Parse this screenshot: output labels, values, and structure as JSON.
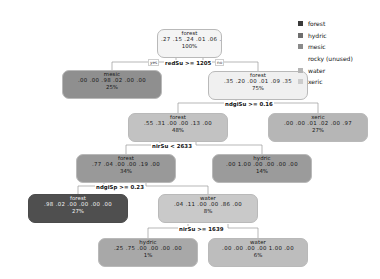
{
  "chart_data": {
    "type": "diagram",
    "subtype": "decision-tree",
    "title": "",
    "class_order": [
      "forest",
      "hydric",
      "mesic",
      "rocky",
      "water",
      "xeric"
    ],
    "legend": {
      "position": "top-right",
      "entries": [
        {
          "label": "forest",
          "color": "#3a3a3a",
          "has_swatch": true
        },
        {
          "label": "hydric",
          "color": "#6e6e6e",
          "has_swatch": true
        },
        {
          "label": "mesic",
          "color": "#8a8a8a",
          "has_swatch": true
        },
        {
          "label": "rocky (unused)",
          "color": "",
          "has_swatch": false
        },
        {
          "label": "water",
          "color": "#b5b5b5",
          "has_swatch": true
        },
        {
          "label": "xeric",
          "color": "#cccccc",
          "has_swatch": true
        }
      ]
    },
    "splits": [
      {
        "id": "split-redsu",
        "text": "redSu >= 1205",
        "yes_label": "yes",
        "no_label": "no"
      },
      {
        "id": "split-ndgisu",
        "text": "ndgiSu >= 0.16",
        "yes_label": "",
        "no_label": ""
      },
      {
        "id": "split-nirsu-2633",
        "text": "nirSu < 2633",
        "yes_label": "",
        "no_label": ""
      },
      {
        "id": "split-ndgisp",
        "text": "ndgiSp >= 0.23",
        "yes_label": "",
        "no_label": ""
      },
      {
        "id": "split-nirsu-1639",
        "text": "nirSu >= 1639",
        "yes_label": "",
        "no_label": ""
      }
    ],
    "nodes": [
      {
        "id": "root",
        "label": "forest",
        "probs": [
          ".27",
          ".15",
          ".24",
          ".01",
          ".06",
          ".27"
        ],
        "pct": "100%",
        "fill": "#f4f4f4",
        "tone": "light"
      },
      {
        "id": "mesic-25",
        "label": "mesic",
        "probs": [
          ".00",
          ".00",
          ".98",
          ".02",
          ".00",
          ".00"
        ],
        "pct": "25%",
        "fill": "#8f8f8f",
        "tone": "mid"
      },
      {
        "id": "forest-75",
        "label": "forest",
        "probs": [
          ".35",
          ".20",
          ".00",
          ".01",
          ".09",
          ".35"
        ],
        "pct": "75%",
        "fill": "#f0f0f0",
        "tone": "light"
      },
      {
        "id": "forest-48",
        "label": "forest",
        "probs": [
          ".55",
          ".31",
          ".00",
          ".00",
          ".13",
          ".00"
        ],
        "pct": "48%",
        "fill": "#c2c2c2",
        "tone": "mid"
      },
      {
        "id": "xeric-27",
        "label": "xeric",
        "probs": [
          ".00",
          ".00",
          ".01",
          ".02",
          ".00",
          ".97"
        ],
        "pct": "27%",
        "fill": "#b6b6b6",
        "tone": "mid"
      },
      {
        "id": "forest-34",
        "label": "forest",
        "probs": [
          ".77",
          ".04",
          ".00",
          ".00",
          ".19",
          ".00"
        ],
        "pct": "34%",
        "fill": "#999999",
        "tone": "mid"
      },
      {
        "id": "hydric-14",
        "label": "hydric",
        "probs": [
          ".00",
          "1.00",
          ".00",
          ".00",
          ".00",
          ".00"
        ],
        "pct": "14%",
        "fill": "#9b9b9b",
        "tone": "mid"
      },
      {
        "id": "forest-27",
        "label": "forest",
        "probs": [
          ".98",
          ".02",
          ".00",
          ".00",
          ".00",
          ".00"
        ],
        "pct": "27%",
        "fill": "#4f4f4f",
        "tone": "dark"
      },
      {
        "id": "water-8",
        "label": "water",
        "probs": [
          ".04",
          ".11",
          ".00",
          ".00",
          ".86",
          ".00"
        ],
        "pct": "8%",
        "fill": "#c9c9c9",
        "tone": "mid"
      },
      {
        "id": "hydric-1",
        "label": "hydric",
        "probs": [
          ".25",
          ".75",
          ".00",
          ".00",
          ".00",
          ".00"
        ],
        "pct": "1%",
        "fill": "#a8a8a8",
        "tone": "mid"
      },
      {
        "id": "water-6",
        "label": "water",
        "probs": [
          ".00",
          ".00",
          ".00",
          ".00",
          "1.00",
          ".00"
        ],
        "pct": "6%",
        "fill": "#bdbdbd",
        "tone": "mid"
      }
    ]
  }
}
